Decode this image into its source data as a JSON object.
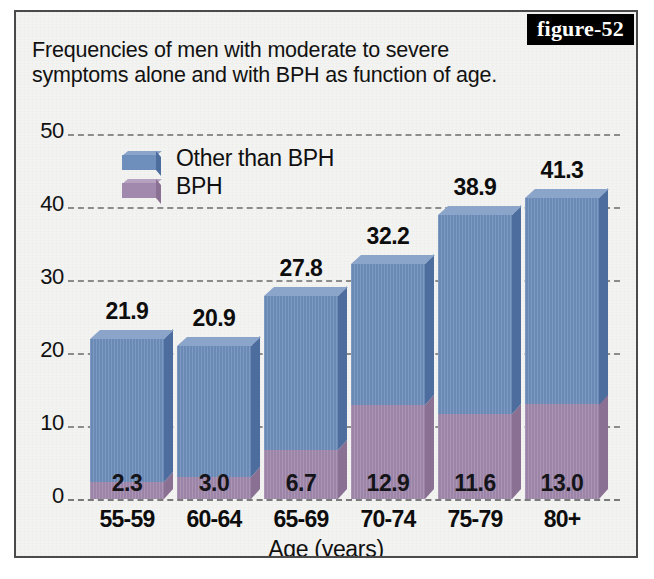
{
  "badge": {
    "label": "figure-52"
  },
  "title": {
    "line1": "Frequencies of men with moderate to severe",
    "line2": "symptoms alone and with BPH as function of age."
  },
  "legend": {
    "position": "inside-top-left",
    "items": [
      {
        "label": "Other than BPH",
        "color": "#6e8ebb",
        "key": "other"
      },
      {
        "label": "BPH",
        "color": "#a189ad",
        "key": "bph"
      }
    ]
  },
  "axes": {
    "x_title": "Age (years)",
    "y_title": "",
    "y_ticks": [
      "0",
      "10",
      "20",
      "30",
      "40",
      "50"
    ]
  },
  "colors": {
    "blue_face": "#6e8ebb",
    "blue_top": "#8ba4c9",
    "blue_side": "#4c6d9e",
    "purple_face": "#a189ad",
    "purple_top": "#b6a2c0",
    "purple_side": "#8a7193",
    "background": "#f3f3f1",
    "frame": "#4a4a4a",
    "gridline": "#8c8c8c",
    "text": "#111111"
  },
  "chart_data": {
    "type": "bar",
    "title": "Frequencies of men with moderate to severe symptoms alone and with BPH as function of age.",
    "subtitle": "",
    "xlabel": "Age (years)",
    "ylabel": "",
    "ylim": [
      0,
      50
    ],
    "yticks": [
      0,
      10,
      20,
      30,
      40,
      50
    ],
    "grid": true,
    "stacked": true,
    "legend_position": "inside-top-left",
    "categories": [
      "55-59",
      "60-64",
      "65-69",
      "70-74",
      "75-79",
      "80+"
    ],
    "series": [
      {
        "name": "BPH",
        "color": "#a189ad",
        "values": [
          2.3,
          3.0,
          6.7,
          12.9,
          11.6,
          13.0
        ]
      },
      {
        "name": "Other than BPH",
        "color": "#6e8ebb",
        "values": [
          19.6,
          17.9,
          21.1,
          19.3,
          27.3,
          28.3
        ]
      }
    ],
    "totals": [
      21.9,
      20.9,
      27.8,
      32.2,
      38.9,
      41.3
    ],
    "total_labels": [
      "21.9",
      "20.9",
      "27.8",
      "32.2",
      "38.9",
      "41.3"
    ],
    "bph_labels": [
      "2.3",
      "3.0",
      "6.7",
      "12.9",
      "11.6",
      "13.0"
    ]
  }
}
